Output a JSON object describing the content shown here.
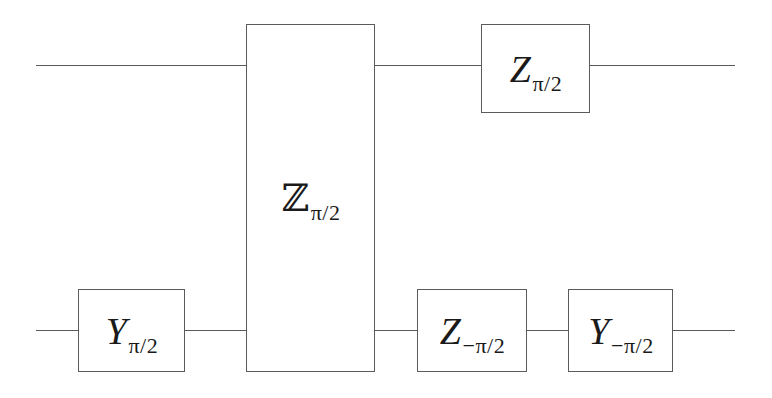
{
  "figure": {
    "kind": "quantum-circuit-diagram",
    "background_color": "#ffffff",
    "line_color": "#5b5b5b",
    "text_color": "#1a1a1a",
    "width": 772,
    "height": 398
  },
  "wires": [
    {
      "name": "top-qubit-wire",
      "y": 65,
      "x_start": 36,
      "x_end": 735
    },
    {
      "name": "bottom-qubit-wire",
      "y": 330,
      "x_start": 36,
      "x_end": 735
    }
  ],
  "gates": [
    {
      "id": "zz-two-qubit-gate",
      "symbol": "ℤ",
      "symbol_name": "double-struck-Z",
      "subscript": "π/2",
      "subscript_sign": "+",
      "full_label": "ℤ_{π/2}",
      "spans_qubits": [
        0,
        1
      ],
      "x": 246,
      "y": 24,
      "width": 129,
      "height": 348
    },
    {
      "id": "z-pi-over-2-top",
      "symbol": "Z",
      "symbol_name": "italic-Z",
      "subscript": "π/2",
      "subscript_sign": "+",
      "full_label": "Z_{π/2}",
      "spans_qubits": [
        0
      ],
      "x": 481,
      "y": 24,
      "width": 109,
      "height": 89
    },
    {
      "id": "y-pi-over-2-bottom",
      "symbol": "Y",
      "symbol_name": "italic-Y",
      "subscript": "π/2",
      "subscript_sign": "+",
      "full_label": "Y_{π/2}",
      "spans_qubits": [
        1
      ],
      "x": 78,
      "y": 289,
      "width": 107,
      "height": 83
    },
    {
      "id": "z-minus-pi-over-2-bottom",
      "symbol": "Z",
      "symbol_name": "italic-Z",
      "subscript": "−π/2",
      "subscript_sign": "−",
      "full_label": "Z_{-π/2}",
      "spans_qubits": [
        1
      ],
      "x": 417,
      "y": 289,
      "width": 110,
      "height": 83
    },
    {
      "id": "y-minus-pi-over-2-bottom",
      "symbol": "Y",
      "symbol_name": "italic-Y",
      "subscript": "−π/2",
      "subscript_sign": "−",
      "full_label": "Y_{-π/2}",
      "spans_qubits": [
        1
      ],
      "x": 568,
      "y": 289,
      "width": 105,
      "height": 83
    }
  ]
}
